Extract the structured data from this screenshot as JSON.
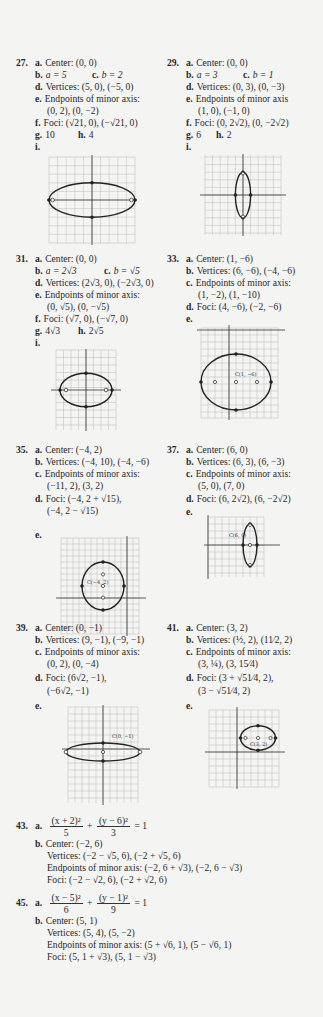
{
  "problems": {
    "p27": {
      "number": "27.",
      "a": "Center: (0, 0)",
      "b": "a = 5",
      "c": "b = 2",
      "d": "Vertices: (5, 0), (−5, 0)",
      "e1": "Endpoints of minor axis:",
      "e2": "(0, 2), (0, −2)",
      "f": "Foci: (√21, 0), (−√21, 0)",
      "g": "10",
      "h": "4",
      "i": ""
    },
    "p29": {
      "number": "29.",
      "a": "Center: (0, 0)",
      "b": "a = 3",
      "c": "b = 1",
      "d": "Vertices: (0, 3), (0, −3)",
      "e1": "Endpoints of minor axis",
      "e2": "(1, 0), (−1, 0)",
      "f": "Foci: (0, 2√2), (0, −2√2)",
      "g": "6",
      "h": "2",
      "i": ""
    },
    "p31": {
      "number": "31.",
      "a": "Center: (0, 0)",
      "b": "a = 2√3",
      "c": "b = √5",
      "d": "Vertices: (2√3, 0), (−2√3, 0)",
      "e1": "Endpoints of minor axis:",
      "e2": "(0, √5), (0, −√5)",
      "f": "Foci: (√7, 0), (−√7, 0)",
      "g": "4√3",
      "h": "2√5",
      "i": ""
    },
    "p33": {
      "number": "33.",
      "a": "Center: (1, −6)",
      "b": "Vertices: (6, −6), (−4, −6)",
      "c1": "Endpoints of minor axis:",
      "c2": "(1, −2), (1, −10)",
      "d": "Foci: (4, −6), (−2, −6)",
      "e": "",
      "graph_label": "C(1, −6)"
    },
    "p35": {
      "number": "35.",
      "a": "Center: (−4, 2)",
      "b": "Vertices: (−4, 10), (−4, −6)",
      "c1": "Endpoints of minor axis:",
      "c2": "(−11, 2), (3, 2)",
      "d1": "Foci: (−4, 2 + √15),",
      "d2": "(−4, 2 − √15)",
      "e": "",
      "graph_label": "C(−4, 2)"
    },
    "p37": {
      "number": "37.",
      "a": "Center: (6, 0)",
      "b": "Vertices: (6, 3), (6, −3)",
      "c1": "Endpoints of minor axis:",
      "c2": "(5, 0), (7, 0)",
      "d": "Foci: (6, 2√2), (6, −2√2)",
      "e": "",
      "graph_label": "C(6, 0)"
    },
    "p39": {
      "number": "39.",
      "a": "Center: (0, −1)",
      "b": "Vertices: (9, −1), (−9, −1)",
      "c1": "Endpoints of minor axis:",
      "c2": "(0, 2), (0, −4)",
      "d1": "Foci: (6√2, −1),",
      "d2": "(−6√2, −1)",
      "e": "",
      "graph_label": "C(0, −1)"
    },
    "p41": {
      "number": "41.",
      "a": "Center: (3, 2)",
      "b": "Vertices: (½, 2), (11⁄2, 2)",
      "c1": "Endpoints of minor axis:",
      "c2": "(3, ¼), (3, 15⁄4)",
      "d1": "Foci: (3 + √51⁄4, 2),",
      "d2": "(3 − √51⁄4, 2)",
      "e": "",
      "graph_label": "C(3, 2)"
    },
    "p43": {
      "number": "43.",
      "a_num1": "(x + 2)²",
      "a_den1": "5",
      "a_plus": "+",
      "a_num2": "(y − 6)²",
      "a_den2": "3",
      "a_eq": "= 1",
      "b_center": "Center: (−2, 6)",
      "b_vertices": "Vertices: (−2 − √5, 6), (−2 + √5, 6)",
      "b_minor": "Endpoints of minor axis: (−2, 6 + √3), (−2, 6 − √3)",
      "b_foci": "Foci: (−2 − √2, 6), (−2 + √2, 6)"
    },
    "p45": {
      "number": "45.",
      "a_num1": "(x − 5)²",
      "a_den1": "6",
      "a_plus": "+",
      "a_num2": "(y − 1)²",
      "a_den2": "9",
      "a_eq": "= 1",
      "b_center": "Center: (5, 1)",
      "b_vertices": "Vertices: (5, 4), (5, −2)",
      "b_minor": "Endpoints of minor axis: (5 + √6, 1), (5 − √6, 1)",
      "b_foci": "Foci: (5, 1 + √3), (5, 1 − √3)"
    }
  },
  "labels": {
    "a": "a.",
    "b": "b.",
    "c": "c.",
    "d": "d.",
    "e": "e.",
    "f": "f.",
    "g": "g.",
    "h": "h.",
    "i": "i."
  },
  "graph_text": {
    "x_axis": "x",
    "y_axis": "y",
    "focus": "F"
  }
}
